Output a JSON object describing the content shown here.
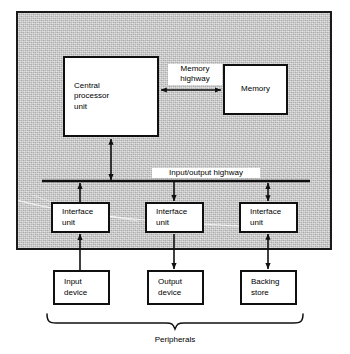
{
  "diagram": {
    "frame": {
      "name": "computer-enclosure"
    },
    "boxes": {
      "cpu": {
        "label": "Central\nprocessor\nunit"
      },
      "memory": {
        "label": "Memory"
      },
      "interface_1": {
        "label": "Interface\nunit"
      },
      "interface_2": {
        "label": "Interface\nunit"
      },
      "interface_3": {
        "label": "Interface\nunit"
      },
      "peripheral_1": {
        "label": "Input\ndevice"
      },
      "peripheral_2": {
        "label": "Output\ndevice"
      },
      "peripheral_3": {
        "label": "Backing\nstore"
      }
    },
    "labels": {
      "memory_highway": "Memory\nhighway",
      "io_highway": "Input/output highway",
      "peripherals": "Peripherals"
    },
    "connections": [
      {
        "from": "cpu",
        "to": "memory",
        "label": "Memory highway",
        "direction": "bidirectional"
      },
      {
        "from": "cpu",
        "to": "io-highway",
        "direction": "bidirectional"
      },
      {
        "from": "interface_1",
        "to": "io-highway",
        "direction": "up"
      },
      {
        "from": "io-highway",
        "to": "interface_2",
        "direction": "down"
      },
      {
        "from": "interface_3",
        "to": "io-highway",
        "direction": "bidirectional"
      },
      {
        "from": "peripheral_1",
        "to": "interface_1",
        "direction": "up"
      },
      {
        "from": "interface_2",
        "to": "peripheral_2",
        "direction": "down"
      },
      {
        "from": "interface_3",
        "to": "peripheral_3",
        "direction": "bidirectional"
      }
    ],
    "colors": {
      "enclosure_fill": "#c9c9c9",
      "box_fill": "#ffffff",
      "line": "#101010",
      "page": "#ffffff"
    }
  }
}
